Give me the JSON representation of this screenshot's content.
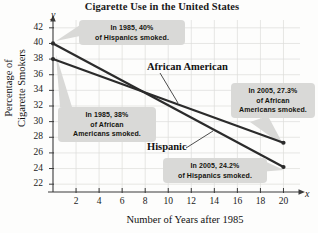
{
  "chart_data": {
    "type": "line",
    "title": "Cigarette Use in the United States",
    "xlabel": "Number of Years after 1985",
    "ylabel_line1": "Percentage of",
    "ylabel_line2": "Cigarette Smokers",
    "x_axis_letter": "x",
    "y_axis_letter": "y",
    "xlim": [
      0,
      21
    ],
    "ylim": [
      21,
      43
    ],
    "grid": true,
    "legend_position": "inline-labels",
    "x_ticks": [
      2,
      4,
      6,
      8,
      10,
      12,
      14,
      16,
      18,
      20
    ],
    "y_ticks": [
      22,
      24,
      26,
      28,
      30,
      32,
      34,
      36,
      38,
      40,
      42
    ],
    "series": [
      {
        "name": "Hispanic",
        "color": "#2b2b2b",
        "x": [
          0,
          20
        ],
        "values": [
          40,
          24.2
        ]
      },
      {
        "name": "African American",
        "color": "#2b2b2b",
        "x": [
          0,
          20
        ],
        "values": [
          38,
          27.3
        ]
      }
    ],
    "annotations": [
      {
        "id": "hispanic-1985",
        "line1": "In 1985, 40%",
        "line2": "of Hispanics smoked.",
        "points_to": {
          "x": 0,
          "y": 40
        }
      },
      {
        "id": "african-american-1985",
        "line1": "In 1985, 38%",
        "line2": "of African",
        "line3": "Americans smoked.",
        "points_to": {
          "x": 0,
          "y": 38
        }
      },
      {
        "id": "african-american-2005",
        "line1": "In 2005, 27.3%",
        "line2": "of African",
        "line3": "Americans smoked.",
        "points_to": {
          "x": 20,
          "y": 27.3
        }
      },
      {
        "id": "hispanic-2005",
        "line1": "In 2005, 24.2%",
        "line2": "of Hispanics smoked.",
        "points_to": {
          "x": 20,
          "y": 24.2
        }
      }
    ]
  }
}
